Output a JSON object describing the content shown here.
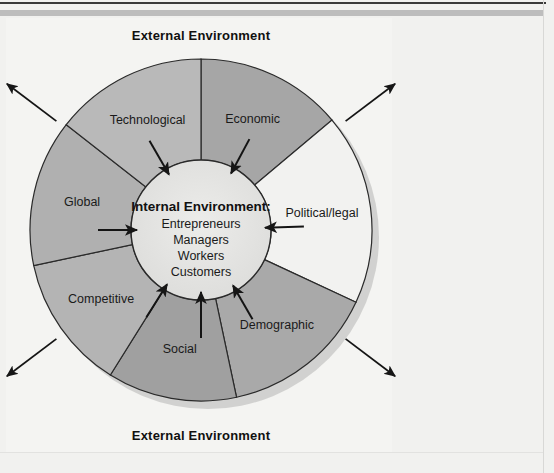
{
  "figure": {
    "banner_top": "External Environment",
    "banner_bottom": "External Environment",
    "center": {
      "heading": "Internal Environment:",
      "items": [
        "Entrepreneurs",
        "Managers",
        "Workers",
        "Customers"
      ]
    },
    "segments": [
      {
        "label": "Economic",
        "color": "#a6a6a6",
        "start": -90,
        "end": -40
      },
      {
        "label": "Political/legal",
        "color": "#f2f2f0",
        "start": -40,
        "end": 25
      },
      {
        "label": "Demographic",
        "color": "#a9a9a9",
        "start": 25,
        "end": 78
      },
      {
        "label": "Social",
        "color": "#a0a0a0",
        "start": 78,
        "end": 122
      },
      {
        "label": "Competitive",
        "color": "#b4b4b4",
        "start": 122,
        "end": 168
      },
      {
        "label": "Global",
        "color": "#b0b0b0",
        "start": 168,
        "end": 218
      },
      {
        "label": "Technological",
        "color": "#b9b9b9",
        "start": 218,
        "end": 270
      }
    ],
    "geometry": {
      "cx": 201,
      "cy": 230,
      "outer_r": 171,
      "inner_r": 70,
      "label_r": 122
    },
    "inner_fill": "#e3e3e1",
    "stroke": "#2a2a2a",
    "arrows_inward": 6,
    "arrows_outward": 4,
    "colors": {
      "page_bg": "#f1f1ef",
      "rule_dark": "#3a3a3a",
      "rule_gray": "#bdbdbd",
      "shadow": "#c9c9c7"
    }
  }
}
